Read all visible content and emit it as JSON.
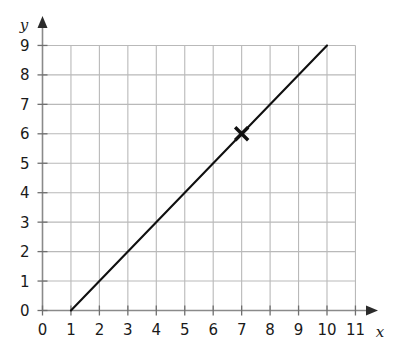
{
  "chart_data": {
    "type": "line",
    "title": "",
    "xlabel": "x",
    "ylabel": "y",
    "xlim": [
      0,
      11
    ],
    "ylim": [
      0,
      9
    ],
    "grid": true,
    "legend": "none",
    "x_ticks": [
      0,
      1,
      2,
      3,
      4,
      5,
      6,
      7,
      8,
      9,
      10,
      11
    ],
    "y_ticks": [
      0,
      1,
      2,
      3,
      4,
      5,
      6,
      7,
      8,
      9
    ],
    "x_tick_labels": [
      "0",
      "1",
      "2",
      "3",
      "4",
      "5",
      "6",
      "7",
      "8",
      "9",
      "10",
      "11"
    ],
    "y_tick_labels": [
      "0",
      "1",
      "2",
      "3",
      "4",
      "5",
      "6",
      "7",
      "8",
      "9"
    ],
    "series": [
      {
        "name": "line",
        "equation": "y = x - 1",
        "slope": 1,
        "intercept": -1,
        "color": "#101010",
        "x": [
          1,
          10
        ],
        "values": [
          0,
          9
        ],
        "points": [
          [
            1,
            0
          ],
          [
            2,
            1
          ],
          [
            3,
            2
          ],
          [
            4,
            3
          ],
          [
            5,
            4
          ],
          [
            6,
            5
          ],
          [
            7,
            6
          ],
          [
            8,
            7
          ],
          [
            9,
            8
          ],
          [
            10,
            9
          ]
        ]
      }
    ],
    "markers": [
      {
        "name": "cross-marker",
        "shape": "x-cross",
        "x": 7,
        "y": 6,
        "color": "#101010",
        "label": ""
      }
    ],
    "annotations": []
  },
  "style": {
    "background": "#ffffff",
    "grid_color": "#b9b9b9",
    "axis_color": "#8a8a8a",
    "line_color": "#101010",
    "text_color": "#1a1a1a"
  },
  "axes": {
    "x_axis_label": "x",
    "y_axis_label": "y",
    "x_arrow": "arrow-right",
    "y_arrow": "arrow-up"
  }
}
